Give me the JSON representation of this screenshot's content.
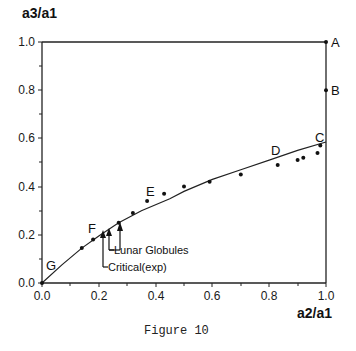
{
  "chart_data": {
    "type": "scatter",
    "title": "",
    "caption": "Figure 10",
    "xlabel": "a2/a1",
    "ylabel": "a3/a1",
    "xlim": [
      0.0,
      1.0
    ],
    "ylim": [
      0.0,
      1.0
    ],
    "x_ticks": [
      "0.0",
      "0.2",
      "0.4",
      "0.6",
      "0.8",
      "1.0"
    ],
    "y_ticks": [
      "0.0",
      "0.2",
      "0.4",
      "0.6",
      "0.8",
      "1.0"
    ],
    "grid": false,
    "series": [
      {
        "name": "data points",
        "kind": "scatter",
        "points": [
          {
            "x": 0.0,
            "y": 0.0
          },
          {
            "x": 0.14,
            "y": 0.145
          },
          {
            "x": 0.18,
            "y": 0.18
          },
          {
            "x": 0.27,
            "y": 0.25
          },
          {
            "x": 0.32,
            "y": 0.29
          },
          {
            "x": 0.37,
            "y": 0.34
          },
          {
            "x": 0.43,
            "y": 0.37
          },
          {
            "x": 0.5,
            "y": 0.4
          },
          {
            "x": 0.59,
            "y": 0.42
          },
          {
            "x": 0.7,
            "y": 0.45
          },
          {
            "x": 0.83,
            "y": 0.49
          },
          {
            "x": 0.9,
            "y": 0.51
          },
          {
            "x": 0.92,
            "y": 0.52
          },
          {
            "x": 0.97,
            "y": 0.54
          },
          {
            "x": 0.98,
            "y": 0.57
          },
          {
            "x": 1.0,
            "y": 0.8
          },
          {
            "x": 1.0,
            "y": 1.0
          }
        ]
      },
      {
        "name": "fitted curve",
        "kind": "line",
        "points": [
          {
            "x": 0.0,
            "y": 0.0
          },
          {
            "x": 0.07,
            "y": 0.075
          },
          {
            "x": 0.14,
            "y": 0.145
          },
          {
            "x": 0.2,
            "y": 0.195
          },
          {
            "x": 0.27,
            "y": 0.25
          },
          {
            "x": 0.35,
            "y": 0.3
          },
          {
            "x": 0.45,
            "y": 0.35
          },
          {
            "x": 0.5,
            "y": 0.38
          },
          {
            "x": 0.6,
            "y": 0.43
          },
          {
            "x": 0.7,
            "y": 0.47
          },
          {
            "x": 0.8,
            "y": 0.51
          },
          {
            "x": 0.9,
            "y": 0.55
          },
          {
            "x": 1.0,
            "y": 0.585
          }
        ]
      }
    ],
    "point_labels": [
      {
        "label": "A",
        "x": 1.0,
        "y": 1.0
      },
      {
        "label": "B",
        "x": 1.0,
        "y": 0.8
      },
      {
        "label": "C",
        "x": 0.98,
        "y": 0.585
      },
      {
        "label": "D",
        "x": 0.83,
        "y": 0.52
      },
      {
        "label": "E",
        "x": 0.37,
        "y": 0.37
      },
      {
        "label": "F",
        "x": 0.18,
        "y": 0.21
      },
      {
        "label": "G",
        "x": 0.0,
        "y": 0.0
      }
    ],
    "annotations": [
      {
        "text": "Lunar Globules",
        "arrows_x": [
          0.235,
          0.275
        ]
      },
      {
        "text": "Critical(exp)",
        "arrows_x": [
          0.215
        ]
      }
    ]
  }
}
